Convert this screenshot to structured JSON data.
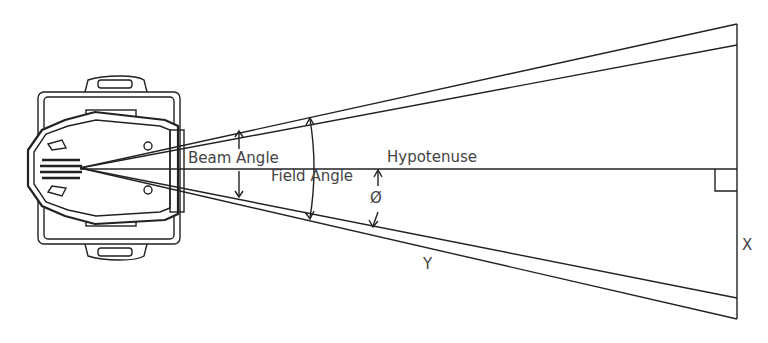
{
  "diagram": {
    "labels": {
      "beam_angle": "Beam Angle",
      "field_angle": "Field Angle",
      "hypotenuse": "Hypotenuse",
      "phi": "Ø",
      "y": "Y",
      "x": "X"
    },
    "colors": {
      "line": "#222222",
      "text": "#444444",
      "background": "#ffffff"
    }
  }
}
